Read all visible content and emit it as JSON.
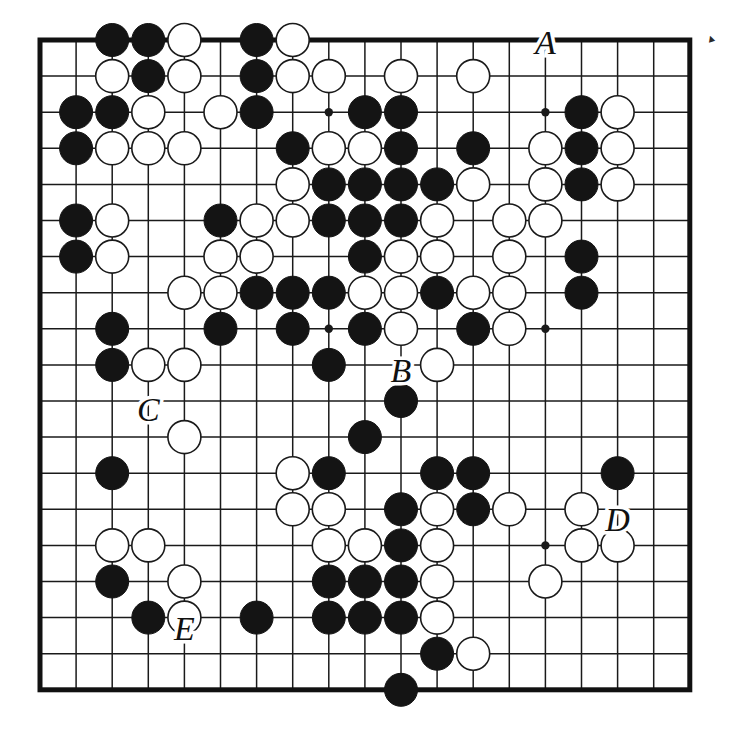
{
  "figure": {
    "kind": "go-board-diagram",
    "board_size": 19,
    "background_color": "#ffffff",
    "line_color": "#1a1a1a",
    "border_color": "#111111",
    "black_stone_color": "#141414",
    "white_stone_color": "#ffffff",
    "white_stone_edge_color": "#1a1a1a",
    "corner_mark": "▴"
  },
  "geometry": {
    "origin_x": 40,
    "origin_y": 40,
    "spacing": 36.1,
    "stone_radius": 16.5,
    "star_radius": 4.2
  },
  "star_points": [
    {
      "col": 3,
      "row": 3
    },
    {
      "col": 9,
      "row": 3
    },
    {
      "col": 15,
      "row": 3
    },
    {
      "col": 3,
      "row": 9
    },
    {
      "col": 9,
      "row": 9
    },
    {
      "col": 15,
      "row": 9
    },
    {
      "col": 3,
      "row": 15
    },
    {
      "col": 9,
      "row": 15
    },
    {
      "col": 15,
      "row": 15
    }
  ],
  "labels": [
    {
      "text": "A",
      "col": 15,
      "row": 1.18
    },
    {
      "text": "B",
      "col": 11,
      "row": 10.25
    },
    {
      "text": "C",
      "col": 4,
      "row": 11.35
    },
    {
      "text": "D",
      "col": 17,
      "row": 14.38
    },
    {
      "text": "E",
      "col": 5,
      "row": 17.4
    }
  ],
  "stones": {
    "black": [
      {
        "col": 3,
        "row": 1
      },
      {
        "col": 4,
        "row": 1
      },
      {
        "col": 7,
        "row": 1
      },
      {
        "col": 4,
        "row": 2
      },
      {
        "col": 7,
        "row": 2
      },
      {
        "col": 2,
        "row": 3
      },
      {
        "col": 3,
        "row": 3
      },
      {
        "col": 7,
        "row": 3
      },
      {
        "col": 10,
        "row": 3
      },
      {
        "col": 11,
        "row": 3
      },
      {
        "col": 16,
        "row": 3
      },
      {
        "col": 2,
        "row": 4
      },
      {
        "col": 8,
        "row": 4
      },
      {
        "col": 11,
        "row": 4
      },
      {
        "col": 13,
        "row": 4
      },
      {
        "col": 16,
        "row": 4
      },
      {
        "col": 9,
        "row": 5
      },
      {
        "col": 10,
        "row": 5
      },
      {
        "col": 11,
        "row": 5
      },
      {
        "col": 12,
        "row": 5
      },
      {
        "col": 16,
        "row": 5
      },
      {
        "col": 2,
        "row": 6
      },
      {
        "col": 6,
        "row": 6
      },
      {
        "col": 9,
        "row": 6
      },
      {
        "col": 10,
        "row": 6
      },
      {
        "col": 11,
        "row": 6
      },
      {
        "col": 2,
        "row": 7
      },
      {
        "col": 10,
        "row": 7
      },
      {
        "col": 16,
        "row": 7
      },
      {
        "col": 7,
        "row": 8
      },
      {
        "col": 8,
        "row": 8
      },
      {
        "col": 9,
        "row": 8
      },
      {
        "col": 12,
        "row": 8
      },
      {
        "col": 16,
        "row": 8
      },
      {
        "col": 3,
        "row": 9
      },
      {
        "col": 6,
        "row": 9
      },
      {
        "col": 8,
        "row": 9
      },
      {
        "col": 10,
        "row": 9
      },
      {
        "col": 13,
        "row": 9
      },
      {
        "col": 3,
        "row": 10
      },
      {
        "col": 9,
        "row": 10
      },
      {
        "col": 11,
        "row": 11
      },
      {
        "col": 10,
        "row": 12
      },
      {
        "col": 3,
        "row": 13
      },
      {
        "col": 9,
        "row": 13
      },
      {
        "col": 12,
        "row": 13
      },
      {
        "col": 13,
        "row": 13
      },
      {
        "col": 17,
        "row": 13
      },
      {
        "col": 11,
        "row": 14
      },
      {
        "col": 13,
        "row": 14
      },
      {
        "col": 11,
        "row": 15
      },
      {
        "col": 3,
        "row": 16
      },
      {
        "col": 9,
        "row": 16
      },
      {
        "col": 10,
        "row": 16
      },
      {
        "col": 11,
        "row": 16
      },
      {
        "col": 4,
        "row": 17
      },
      {
        "col": 7,
        "row": 17
      },
      {
        "col": 9,
        "row": 17
      },
      {
        "col": 10,
        "row": 17
      },
      {
        "col": 11,
        "row": 17
      },
      {
        "col": 12,
        "row": 18
      },
      {
        "col": 11,
        "row": 19
      }
    ],
    "white": [
      {
        "col": 5,
        "row": 1
      },
      {
        "col": 8,
        "row": 1
      },
      {
        "col": 3,
        "row": 2
      },
      {
        "col": 5,
        "row": 2
      },
      {
        "col": 8,
        "row": 2
      },
      {
        "col": 9,
        "row": 2
      },
      {
        "col": 11,
        "row": 2
      },
      {
        "col": 13,
        "row": 2
      },
      {
        "col": 4,
        "row": 3
      },
      {
        "col": 6,
        "row": 3
      },
      {
        "col": 17,
        "row": 3
      },
      {
        "col": 3,
        "row": 4
      },
      {
        "col": 4,
        "row": 4
      },
      {
        "col": 5,
        "row": 4
      },
      {
        "col": 9,
        "row": 4
      },
      {
        "col": 10,
        "row": 4
      },
      {
        "col": 15,
        "row": 4
      },
      {
        "col": 17,
        "row": 4
      },
      {
        "col": 8,
        "row": 5
      },
      {
        "col": 13,
        "row": 5
      },
      {
        "col": 15,
        "row": 5
      },
      {
        "col": 17,
        "row": 5
      },
      {
        "col": 3,
        "row": 6
      },
      {
        "col": 7,
        "row": 6
      },
      {
        "col": 8,
        "row": 6
      },
      {
        "col": 12,
        "row": 6
      },
      {
        "col": 14,
        "row": 6
      },
      {
        "col": 15,
        "row": 6
      },
      {
        "col": 3,
        "row": 7
      },
      {
        "col": 6,
        "row": 7
      },
      {
        "col": 7,
        "row": 7
      },
      {
        "col": 11,
        "row": 7
      },
      {
        "col": 12,
        "row": 7
      },
      {
        "col": 14,
        "row": 7
      },
      {
        "col": 5,
        "row": 8
      },
      {
        "col": 6,
        "row": 8
      },
      {
        "col": 10,
        "row": 8
      },
      {
        "col": 11,
        "row": 8
      },
      {
        "col": 13,
        "row": 8
      },
      {
        "col": 14,
        "row": 8
      },
      {
        "col": 11,
        "row": 9
      },
      {
        "col": 14,
        "row": 9
      },
      {
        "col": 4,
        "row": 10
      },
      {
        "col": 5,
        "row": 10
      },
      {
        "col": 12,
        "row": 10
      },
      {
        "col": 5,
        "row": 12
      },
      {
        "col": 8,
        "row": 13
      },
      {
        "col": 8,
        "row": 14
      },
      {
        "col": 9,
        "row": 14
      },
      {
        "col": 12,
        "row": 14
      },
      {
        "col": 14,
        "row": 14
      },
      {
        "col": 16,
        "row": 14
      },
      {
        "col": 3,
        "row": 15
      },
      {
        "col": 4,
        "row": 15
      },
      {
        "col": 9,
        "row": 15
      },
      {
        "col": 10,
        "row": 15
      },
      {
        "col": 12,
        "row": 15
      },
      {
        "col": 16,
        "row": 15
      },
      {
        "col": 17,
        "row": 15
      },
      {
        "col": 5,
        "row": 16
      },
      {
        "col": 12,
        "row": 16
      },
      {
        "col": 15,
        "row": 16
      },
      {
        "col": 5,
        "row": 17
      },
      {
        "col": 12,
        "row": 17
      },
      {
        "col": 13,
        "row": 18
      }
    ]
  }
}
